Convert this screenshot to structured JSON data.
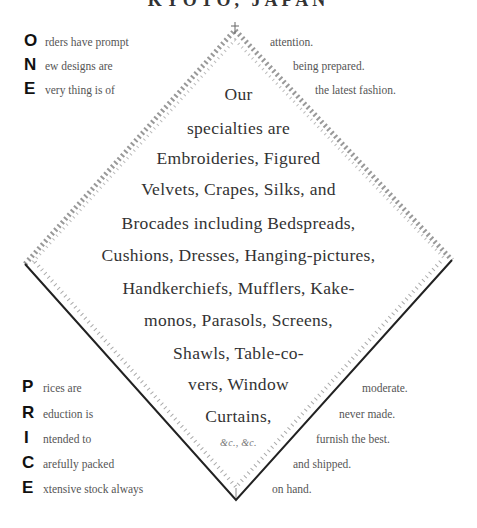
{
  "header": {
    "title": "KYOTO, JAPAN"
  },
  "one_acrostic": {
    "rows": [
      {
        "initial": "O",
        "left": "rders have prompt",
        "right": "attention."
      },
      {
        "initial": "N",
        "left": "ew designs are",
        "right": "being prepared."
      },
      {
        "initial": "E",
        "left": "very thing is of",
        "right": "the latest fashion."
      }
    ]
  },
  "diamond": {
    "lines": [
      "Our",
      "specialties are",
      "Embroideries, Figured",
      "Velvets, Crapes, Silks, and",
      "Brocades including Bedspreads,",
      "Cushions, Dresses, Hanging-pictures,",
      "Handkerchiefs, Mufflers, Kake-",
      "monos, Parasols, Screens,",
      "Shawls, Table-co-",
      "vers, Window",
      "Curtains,"
    ],
    "etc": "&c., &c."
  },
  "price_acrostic": {
    "rows": [
      {
        "initial": "P",
        "left": "rices are",
        "right": "moderate."
      },
      {
        "initial": "R",
        "left": "eduction is",
        "right": "never made."
      },
      {
        "initial": "I",
        "left": "ntended to",
        "right": "furnish the best."
      },
      {
        "initial": "C",
        "left": "arefully packed",
        "right": "and shipped."
      },
      {
        "initial": "E",
        "left": "xtensive stock always",
        "right": "on hand."
      }
    ]
  }
}
